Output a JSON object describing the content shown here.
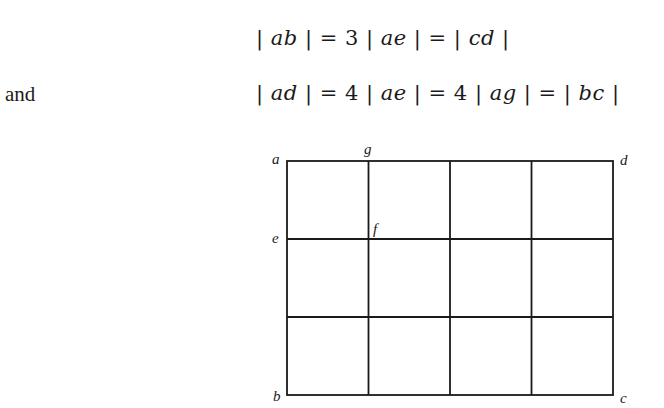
{
  "equations": {
    "line1": {
      "text": "| ab | = 3 | ae | = | cd |",
      "parts": [
        "| ",
        "ab",
        " | = 3 | ",
        "ae",
        " | = | ",
        "cd",
        " |"
      ]
    },
    "connector": "and",
    "line2": {
      "text": "| ad | = 4 | ae | = 4 | ag | = | bc |",
      "parts": [
        "| ",
        "ad",
        " | = 4 | ",
        "ae",
        " | = 4 | ",
        "ag",
        " | = | ",
        "bc",
        " |"
      ]
    }
  },
  "figure": {
    "type": "rectangular grid",
    "columns": 4,
    "rows": 3,
    "stroke_color": "#1a1a1a",
    "points": {
      "a": "a",
      "b": "b",
      "c": "c",
      "d": "d",
      "e": "e",
      "f": "f",
      "g": "g"
    }
  }
}
